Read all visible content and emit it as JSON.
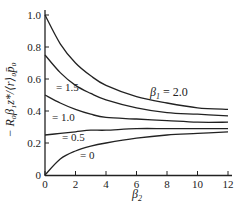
{
  "chart_data": {
    "type": "line",
    "title": "",
    "xlabel": "β2",
    "ylabel": "−R0β1z*/⟨r⟩0p̄0",
    "xlim": [
      0,
      12
    ],
    "ylim": [
      0,
      1.0
    ],
    "x_ticks": [
      "0",
      "2",
      "4",
      "6",
      "8",
      "10",
      "12"
    ],
    "y_ticks": [
      "0",
      "0.2",
      "0.4",
      "0.6",
      "0.8",
      "1.0"
    ],
    "grid": false,
    "x": [
      0,
      1,
      2,
      3,
      4,
      6,
      8,
      10,
      12
    ],
    "series": [
      {
        "name": "β1 = 2.0",
        "values": [
          1.0,
          0.82,
          0.7,
          0.62,
          0.56,
          0.49,
          0.45,
          0.42,
          0.41
        ]
      },
      {
        "name": "= 1.5",
        "values": [
          0.75,
          0.64,
          0.56,
          0.51,
          0.47,
          0.42,
          0.39,
          0.38,
          0.37
        ]
      },
      {
        "name": "= 1.0",
        "values": [
          0.5,
          0.45,
          0.41,
          0.38,
          0.36,
          0.35,
          0.34,
          0.33,
          0.33
        ]
      },
      {
        "name": "= 0.5",
        "values": [
          0.25,
          0.26,
          0.27,
          0.28,
          0.28,
          0.29,
          0.29,
          0.29,
          0.29
        ]
      },
      {
        "name": "= 0",
        "values": [
          0.0,
          0.1,
          0.15,
          0.18,
          0.2,
          0.23,
          0.25,
          0.26,
          0.27
        ]
      }
    ],
    "annotations": [
      "β1 = 2.0",
      "= 1.5",
      "= 1.0",
      "= 0.5",
      "= 0"
    ]
  },
  "labels": {
    "xlabel": "β",
    "xlabel_sub": "2",
    "ylabel": "− R₀β₁z*/⟨r⟩₀p̄₀",
    "ann0": "β",
    "ann0_sub": "1",
    "ann0_val": " = 2.0",
    "ann1": "= 1.5",
    "ann2": "= 1.0",
    "ann3": "= 0.5",
    "ann4": "= 0"
  }
}
